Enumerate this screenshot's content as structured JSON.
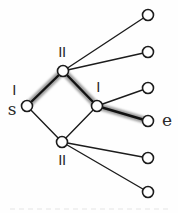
{
  "diagram": {
    "type": "graph",
    "colors": {
      "background": "#fefefe",
      "edge": "#1c1c1c",
      "edge_highlight_core": "#111111",
      "highlight_halo": "#9e9e9e",
      "node_fill": "#ffffff",
      "node_stroke": "#1c1c1c",
      "label": "#2a2a2a",
      "caption_remnant": "#e4e4e4"
    },
    "node_radius": 5.5,
    "node_stroke_width": 1.6,
    "edge_width": 1.4,
    "highlight_core_width": 2.4,
    "highlight_halo_width": 7,
    "nodes": [
      {
        "id": "s",
        "x": 27,
        "y": 106
      },
      {
        "id": "top",
        "x": 63,
        "y": 71
      },
      {
        "id": "mid",
        "x": 97,
        "y": 106
      },
      {
        "id": "bottom",
        "x": 62,
        "y": 142
      },
      {
        "id": "e",
        "x": 148,
        "y": 121
      },
      {
        "id": "leaf1",
        "x": 148,
        "y": 15
      },
      {
        "id": "leaf2",
        "x": 148,
        "y": 52
      },
      {
        "id": "leaf3",
        "x": 148,
        "y": 88
      },
      {
        "id": "leaf4",
        "x": 148,
        "y": 158
      },
      {
        "id": "leaf5",
        "x": 148,
        "y": 192
      }
    ],
    "edges": [
      {
        "from": "s",
        "to": "top",
        "highlighted": true
      },
      {
        "from": "top",
        "to": "mid",
        "highlighted": true
      },
      {
        "from": "mid",
        "to": "e",
        "highlighted": true
      },
      {
        "from": "top",
        "to": "leaf1",
        "highlighted": false
      },
      {
        "from": "top",
        "to": "leaf2",
        "highlighted": false
      },
      {
        "from": "mid",
        "to": "leaf3",
        "highlighted": false
      },
      {
        "from": "s",
        "to": "bottom",
        "highlighted": false
      },
      {
        "from": "bottom",
        "to": "mid",
        "highlighted": false
      },
      {
        "from": "bottom",
        "to": "leaf4",
        "highlighted": false
      },
      {
        "from": "bottom",
        "to": "leaf5",
        "highlighted": false
      }
    ],
    "labels": [
      {
        "id": "tick-top",
        "text": "II",
        "x": 62,
        "y": 57,
        "anchor": "middle",
        "font": "ticks"
      },
      {
        "id": "tick-s",
        "text": "I",
        "x": 14,
        "y": 95,
        "anchor": "middle",
        "font": "ticks"
      },
      {
        "id": "label-s",
        "text": "s",
        "x": 12,
        "y": 115,
        "anchor": "middle",
        "font": "letters"
      },
      {
        "id": "tick-mid",
        "text": "I",
        "x": 98,
        "y": 92,
        "anchor": "middle",
        "font": "ticks"
      },
      {
        "id": "label-e",
        "text": "e",
        "x": 162,
        "y": 126,
        "anchor": "start",
        "font": "letters"
      },
      {
        "id": "tick-bottom",
        "text": "II",
        "x": 62,
        "y": 165,
        "anchor": "middle",
        "font": "ticks"
      }
    ]
  }
}
